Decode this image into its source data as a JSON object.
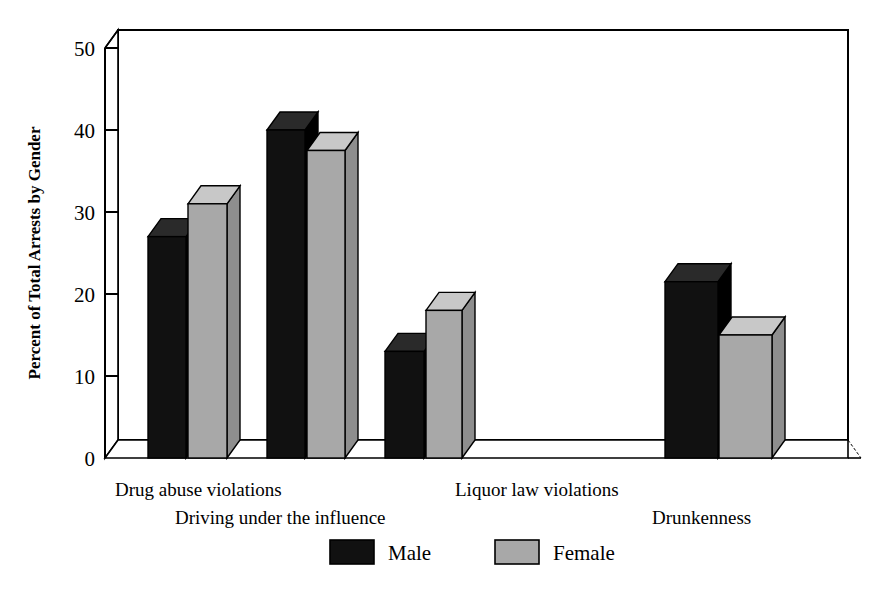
{
  "chart_data": {
    "type": "bar",
    "title": "",
    "xlabel": "",
    "ylabel": "Percent of Total Arrests by Gender",
    "ylim": [
      0,
      50
    ],
    "yticks": [
      0,
      10,
      20,
      30,
      40,
      50
    ],
    "ytick_labels": [
      "0",
      "10",
      "20",
      "30",
      "40",
      "50"
    ],
    "grid": false,
    "three_d": true,
    "legend_position": "bottom-center",
    "categories": [
      "Drug abuse violations",
      "Driving under the influence",
      "Liquor law violations",
      "Drunkenness"
    ],
    "series": [
      {
        "name": "Male",
        "color": "#111111",
        "values": [
          27,
          40,
          13,
          21.5
        ]
      },
      {
        "name": "Female",
        "color": "#a8a8a8",
        "values": [
          31,
          37.5,
          18,
          15
        ]
      }
    ]
  },
  "axis": {
    "y_label": "Percent of Total Arrests by Gender",
    "ticks": [
      {
        "value": 50,
        "label": "50"
      },
      {
        "value": 40,
        "label": "40"
      },
      {
        "value": 30,
        "label": "30"
      },
      {
        "value": 20,
        "label": "20"
      },
      {
        "value": 10,
        "label": "10"
      },
      {
        "value": 0,
        "label": "0"
      }
    ]
  },
  "category_labels": [
    {
      "text": "Drug abuse violations",
      "row": "top"
    },
    {
      "text": "Driving under the influence",
      "row": "bottom"
    },
    {
      "text": "Liquor law violations",
      "row": "top"
    },
    {
      "text": "Drunkenness",
      "row": "bottom"
    }
  ],
  "legend": {
    "items": [
      {
        "label": "Male",
        "color": "#111111"
      },
      {
        "label": "Female",
        "color": "#a8a8a8"
      }
    ]
  },
  "colors": {
    "male": "#111111",
    "female": "#a8a8a8",
    "female_top": "#c8c8c8",
    "female_side": "#8e8e8e",
    "outline": "#000000",
    "background": "#ffffff",
    "floor": "#ffffff"
  }
}
